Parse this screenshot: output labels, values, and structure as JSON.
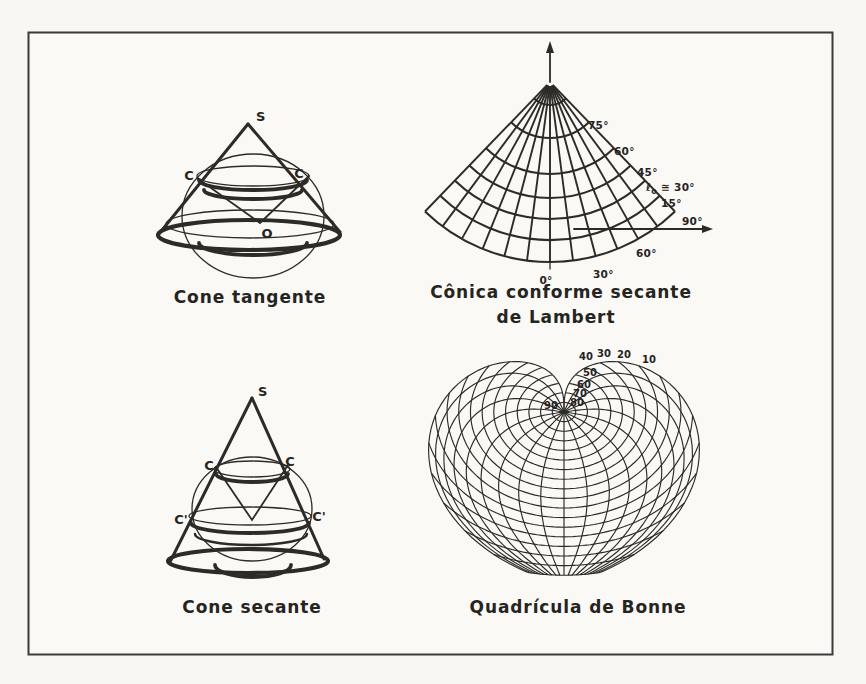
{
  "page": {
    "background": "#f8f7f3",
    "ink": "#2d2b28",
    "border_color": "#3b3b3b"
  },
  "panels": {
    "cone_tangente": {
      "caption": "Cone tangente",
      "apex_label": "S",
      "tangent_left_label": "C",
      "tangent_right_label": "C",
      "center_label": "O"
    },
    "lambert": {
      "caption_line1": "Cônica conforme secante",
      "caption_line2": "de Lambert",
      "parallel_labels": [
        "75°",
        "60°",
        "45°",
        "15°"
      ],
      "standard_parallel": {
        "symbol": "ℓ",
        "subscript": "o",
        "value": " ≅ 30°"
      },
      "meridian_labels": [
        "90°",
        "60°",
        "30°",
        "0°"
      ]
    },
    "cone_secante": {
      "caption": "Cone secante",
      "apex_label": "S",
      "upper_left_label": "C",
      "upper_right_label": "C",
      "lower_left_label": "C'",
      "lower_right_label": "C'"
    },
    "bonne": {
      "caption": "Quadrícula de Bonne",
      "latitude_labels": [
        "10",
        "20",
        "30",
        "40",
        "50",
        "60",
        "70",
        "80",
        "90"
      ]
    }
  }
}
